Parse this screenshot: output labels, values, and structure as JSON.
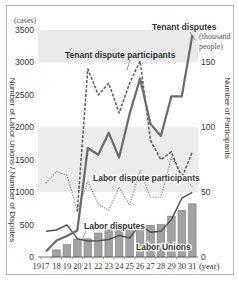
{
  "chart_data": {
    "type": "bar+line",
    "title": "",
    "x": [
      1917,
      1918,
      1919,
      1920,
      1921,
      1922,
      1923,
      1924,
      1925,
      1926,
      1927,
      1928,
      1929,
      1930,
      1931
    ],
    "x_tick_labels": [
      "1917",
      "18",
      "19",
      "20",
      "21",
      "22",
      "23",
      "24",
      "25",
      "26",
      "27",
      "28",
      "29",
      "30",
      "31"
    ],
    "x_unit": "(year)",
    "left_axis": {
      "label": "Number of Labor Unions / Number of Disputes",
      "unit": "(cases)",
      "ticks": [
        0,
        500,
        1000,
        1500,
        2000,
        2500,
        3000,
        3500
      ],
      "ylim": [
        0,
        3500
      ]
    },
    "right_axis": {
      "label": "Number of Participants",
      "unit_line1": "(thousand",
      "unit_line2": "people)",
      "ticks": [
        0,
        50,
        100,
        150
      ],
      "ylim": [
        0,
        175
      ]
    },
    "grid": "shaded horizontal bands",
    "series": [
      {
        "name": "Labor Unions",
        "type": "bar",
        "axis": "left",
        "x": [
          1918,
          1919,
          1920,
          1921,
          1922,
          1923,
          1924,
          1925,
          1926,
          1927,
          1928,
          1929,
          1930,
          1931
        ],
        "values": [
          110,
          190,
          270,
          280,
          370,
          420,
          460,
          430,
          490,
          490,
          500,
          630,
          720,
          820
        ],
        "color": "#9e9e9e"
      },
      {
        "name": "Tenant disputes",
        "type": "line",
        "style": "solid-thick",
        "axis": "left",
        "x": [
          1917,
          1918,
          1919,
          1920,
          1921,
          1922,
          1923,
          1924,
          1925,
          1926,
          1927,
          1928,
          1929,
          1930,
          1931
        ],
        "values": [
          85,
          256,
          326,
          408,
          1680,
          1578,
          1917,
          1532,
          2206,
          2751,
          2052,
          1866,
          2478,
          2478,
          3419
        ],
        "color": "#666666"
      },
      {
        "name": "Labor disputes",
        "type": "line",
        "style": "solid-thin",
        "axis": "left",
        "x": [
          1917,
          1918,
          1919,
          1920,
          1921,
          1922,
          1923,
          1924,
          1925,
          1926,
          1927,
          1928,
          1929,
          1930,
          1931
        ],
        "values": [
          398,
          417,
          497,
          282,
          246,
          250,
          270,
          333,
          293,
          495,
          383,
          397,
          576,
          906,
          998
        ],
        "color": "#555555"
      },
      {
        "name": "Tenant dispute participants",
        "type": "line",
        "style": "dashed",
        "axis": "right",
        "x": [
          1920,
          1921,
          1922,
          1923,
          1924,
          1925,
          1926,
          1927,
          1928,
          1929,
          1930,
          1931
        ],
        "values": [
          35,
          145,
          125,
          134,
          111,
          134,
          151,
          90,
          75,
          81,
          61,
          81
        ],
        "color": "#666666"
      },
      {
        "name": "Labor dispute participants",
        "type": "line",
        "style": "dotted",
        "axis": "right",
        "x": [
          1917,
          1918,
          1919,
          1920,
          1921,
          1922,
          1923,
          1924,
          1925,
          1926,
          1927,
          1928,
          1929,
          1930,
          1931
        ],
        "values": [
          57,
          66,
          63,
          36,
          58,
          41,
          36,
          54,
          40,
          67,
          46,
          46,
          77,
          64,
          54
        ],
        "color": "#888888"
      }
    ],
    "annotations": [
      {
        "text": "Tenant disputes",
        "near": 1931
      },
      {
        "text": "Tenant dispute participants",
        "near": 1925
      },
      {
        "text": "Labor dispute participants",
        "near": 1924
      },
      {
        "text": "Labor disputes",
        "near": 1921
      },
      {
        "text": "Labor Unions",
        "near": 1927
      }
    ]
  }
}
